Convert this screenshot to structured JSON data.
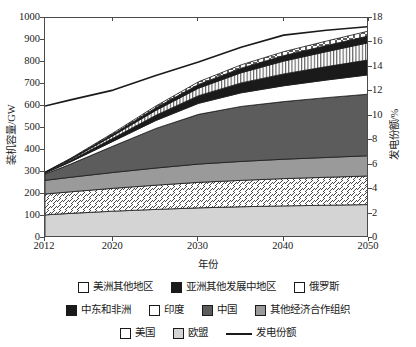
{
  "chart_data": {
    "type": "area",
    "title": "",
    "subtitle": "",
    "xlabel": "年份",
    "ylabel": "装机容量/GW",
    "y2label": "发电份额/%",
    "x": [
      2012,
      2015,
      2020,
      2025,
      2030,
      2035,
      2040,
      2045,
      2050
    ],
    "xlim": [
      2012,
      2050
    ],
    "ylim": [
      0,
      1000
    ],
    "y2lim": [
      0,
      18
    ],
    "xticks": [
      "2012",
      "2020",
      "2030",
      "2040",
      "2050"
    ],
    "xtick_values": [
      2012,
      2020,
      2030,
      2040,
      2050
    ],
    "yticks": [
      "0",
      "100",
      "200",
      "300",
      "400",
      "500",
      "600",
      "700",
      "800",
      "900",
      "1000"
    ],
    "ytick_values": [
      0,
      100,
      200,
      300,
      400,
      500,
      600,
      700,
      800,
      900,
      1000
    ],
    "y2ticks": [
      "0",
      "2",
      "4",
      "6",
      "8",
      "10",
      "12",
      "14",
      "16",
      "18"
    ],
    "y2tick_values": [
      0,
      2,
      4,
      6,
      8,
      10,
      12,
      14,
      16,
      18
    ],
    "grid": false,
    "legend_position": "bottom",
    "stacking": "bottom-to-top",
    "series": [
      {
        "name": "欧盟",
        "pattern": "solid-light-gray",
        "color": "#d4d4d4",
        "values": [
          105,
          112,
          122,
          130,
          137,
          142,
          146,
          149,
          152
        ]
      },
      {
        "name": "美国",
        "pattern": "hatch-forward",
        "color": "#ffffff",
        "values": [
          95,
          98,
          104,
          110,
          116,
          120,
          124,
          127,
          130
        ]
      },
      {
        "name": "其他经济合作组织",
        "pattern": "solid-medium-gray",
        "color": "#9a9a9a",
        "values": [
          62,
          66,
          72,
          78,
          83,
          86,
          88,
          90,
          92
        ]
      },
      {
        "name": "中国",
        "pattern": "solid-dark-gray",
        "color": "#5c5c5c",
        "values": [
          28,
          60,
          120,
          180,
          226,
          250,
          262,
          272,
          280
        ]
      },
      {
        "name": "印度",
        "pattern": "solid-white",
        "color": "#ffffff",
        "values": [
          4,
          10,
          22,
          36,
          50,
          62,
          72,
          80,
          88
        ]
      },
      {
        "name": "中东和非洲",
        "pattern": "solid-black",
        "color": "#1a1a1a",
        "values": [
          2,
          6,
          14,
          24,
          35,
          45,
          54,
          61,
          68
        ]
      },
      {
        "name": "俄罗斯",
        "pattern": "vertical-lines",
        "color": "#ffffff",
        "values": [
          2,
          5,
          12,
          22,
          34,
          46,
          58,
          68,
          78
        ]
      },
      {
        "name": "亚洲其他发展中地区",
        "pattern": "solid-black",
        "color": "#1a1a1a",
        "values": [
          1,
          3,
          7,
          12,
          17,
          21,
          25,
          28,
          31
        ]
      },
      {
        "name": "美洲其他地区",
        "pattern": "hatch-cross",
        "color": "#ffffff",
        "values": [
          1,
          2,
          5,
          8,
          12,
          15,
          18,
          20,
          22
        ]
      }
    ],
    "stack_totals": [
      300,
      362,
      478,
      600,
      710,
      787,
      847,
      895,
      941
    ],
    "line_series": {
      "name": "发电份额",
      "axis": "y2",
      "color": "#1a1a1a",
      "y2_values": [
        10.8,
        11.3,
        12.1,
        13.3,
        14.4,
        15.6,
        16.6,
        17.0,
        17.3
      ],
      "y1_equivalent": [
        600,
        628,
        672,
        739,
        800,
        867,
        922,
        944,
        961
      ]
    }
  },
  "legend": {
    "rows": [
      [
        {
          "label": "美洲其他地区",
          "swatch": "hatch-cross"
        },
        {
          "label": "亚洲其他发展中地区",
          "swatch": "solid-black"
        },
        {
          "label": "俄罗斯",
          "swatch": "vertical-lines"
        }
      ],
      [
        {
          "label": "中东和非洲",
          "swatch": "solid-black"
        },
        {
          "label": "印度",
          "swatch": "solid-white"
        },
        {
          "label": "中国",
          "swatch": "solid-dark-gray"
        },
        {
          "label": "其他经济合作组织",
          "swatch": "solid-medium-gray"
        }
      ],
      [
        {
          "label": "美国",
          "swatch": "hatch-forward"
        },
        {
          "label": "欧盟",
          "swatch": "solid-light-gray"
        },
        {
          "label": "发电份额",
          "swatch": "line"
        }
      ]
    ]
  },
  "colors": {
    "axis": "#4a4a4a",
    "text": "#1a1a1a",
    "light_gray": "#d4d4d4",
    "medium_gray": "#9a9a9a",
    "dark_gray": "#5c5c5c",
    "black": "#1a1a1a",
    "white": "#ffffff"
  }
}
